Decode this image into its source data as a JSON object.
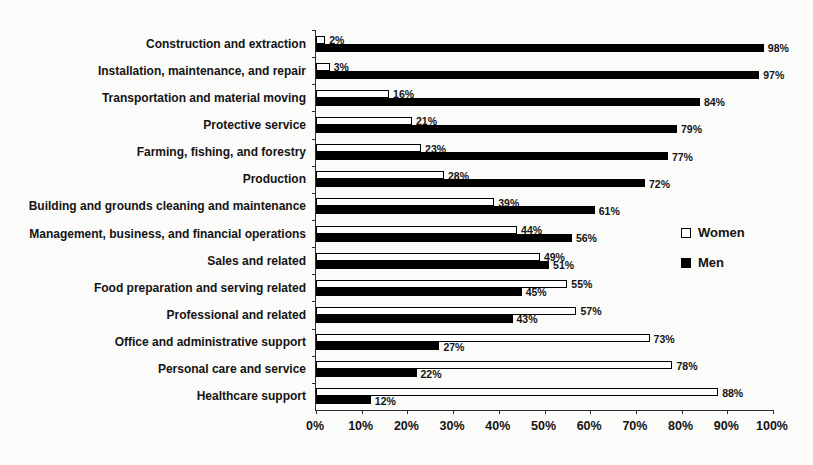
{
  "chart_data": {
    "type": "bar",
    "orientation": "horizontal",
    "title": "",
    "xlabel": "",
    "ylabel": "",
    "xlim": [
      0,
      100
    ],
    "grid": false,
    "legend_position": "right",
    "value_suffix": "%",
    "categories": [
      "Construction and extraction",
      "Installation, maintenance, and repair",
      "Transportation and material moving",
      "Protective service",
      "Farming, fishing, and forestry",
      "Production",
      "Building and grounds cleaning and maintenance",
      "Management, business, and financial operations",
      "Sales and related",
      "Food preparation and serving related",
      "Professional and related",
      "Office and administrative support",
      "Personal care and service",
      "Healthcare support"
    ],
    "series": [
      {
        "name": "Women",
        "values": [
          2,
          3,
          16,
          21,
          23,
          28,
          39,
          44,
          49,
          55,
          57,
          73,
          78,
          88
        ],
        "fill": "#ffffff",
        "border": "#000000"
      },
      {
        "name": "Men",
        "values": [
          98,
          97,
          84,
          79,
          77,
          72,
          61,
          56,
          51,
          45,
          43,
          27,
          22,
          12
        ],
        "fill": "#000000",
        "border": "#000000"
      }
    ],
    "x_ticks": [
      "0%",
      "10%",
      "20%",
      "30%",
      "40%",
      "50%",
      "60%",
      "70%",
      "80%",
      "90%",
      "100%"
    ],
    "colors": {
      "axis": "#2d2d2d",
      "text": "#141414",
      "background": "#fbfbf9"
    }
  }
}
